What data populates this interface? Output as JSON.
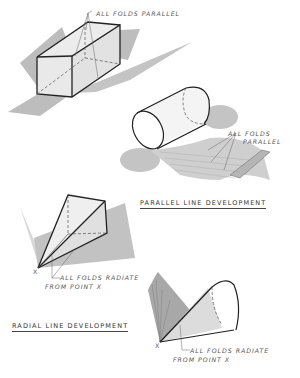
{
  "figure": {
    "prism": {
      "annotation": "ALL FOLDS PARALLEL"
    },
    "cylinder": {
      "annotation_line1": "ALL FOLDS",
      "annotation_line2": "PARALLEL"
    },
    "parallel_section_title": "PARALLEL LINE DEVELOPMENT",
    "pyramid": {
      "point_label": "X",
      "annotation_line1": "ALL FOLDS RADIATE",
      "annotation_line2": "FROM POINT X"
    },
    "radial_section_title": "RADIAL LINE DEVELOPMENT",
    "cone": {
      "point_label": "X",
      "annotation_line1": "ALL FOLDS RADIATE",
      "annotation_line2": "FROM POINT X"
    }
  },
  "colors": {
    "ink": "#222222",
    "fill_gray": "#bdbdbd",
    "fill_light": "#e2e2e2",
    "paper": "#ffffff"
  }
}
